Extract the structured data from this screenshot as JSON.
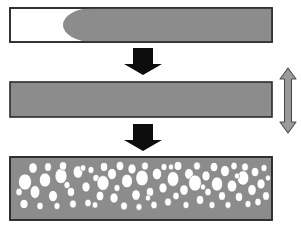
{
  "figure": {
    "type": "process-diagram",
    "width": 301,
    "height": 233,
    "background_color": "#ffffff"
  },
  "colors": {
    "material_gray": "#8c8c8c",
    "outline_dark": "#2b2b2b",
    "cavity_white": "#ffffff",
    "arrow_black": "#0d0d0d",
    "expansion_arrow_fill": "#9a9a9a",
    "expansion_arrow_stroke": "#4d4d4d",
    "pore_white": "#ffffff",
    "pore_stroke": "#6e6e6e"
  },
  "stages": [
    {
      "id": "stage-1-partial-fill",
      "label": "Partially filled cavity with advancing melt front",
      "x": 10,
      "y": 8,
      "width": 262,
      "height": 34,
      "fill": "#ffffff",
      "stroke": "#2b2b2b",
      "melt": {
        "label": "Injected melt with rounded flow front",
        "fill": "#8c8c8c",
        "front_x": 93,
        "right_x": 272,
        "front_radius_x": 30
      }
    },
    {
      "id": "stage-2-full-fill",
      "label": "Completely filled cavity, solid melt",
      "x": 10,
      "y": 82,
      "width": 262,
      "height": 35,
      "fill": "#8c8c8c",
      "stroke": "#2b2b2b"
    },
    {
      "id": "stage-3-foamed",
      "label": "Foamed part with cellular pore structure",
      "x": 10,
      "y": 157,
      "width": 262,
      "height": 63,
      "fill": "#8c8c8c",
      "stroke": "#2b2b2b"
    }
  ],
  "flow_arrows": [
    {
      "id": "flow-arrow-1",
      "label": "Process step from stage 1 to stage 2",
      "cx": 143,
      "top_y": 48,
      "bottom_y": 75,
      "shaft_half_width": 10,
      "head_half_width": 19,
      "head_height": 11,
      "fill": "#0d0d0d"
    },
    {
      "id": "flow-arrow-2",
      "label": "Process step from stage 2 to stage 3",
      "cx": 143,
      "top_y": 124,
      "bottom_y": 151,
      "shaft_half_width": 10,
      "head_half_width": 19,
      "head_height": 11,
      "fill": "#0d0d0d"
    }
  ],
  "expansion_arrow": {
    "id": "expansion-arrow",
    "label": "Vertical double-headed arrow indicating mould opening / thickness expansion",
    "cx": 288,
    "top_y": 68,
    "bottom_y": 133,
    "shaft_half_width": 3.5,
    "head_half_width": 8,
    "head_height": 11,
    "fill": "#9a9a9a",
    "stroke": "#4d4d4d"
  },
  "pores": {
    "label": "White elliptical gas cells distributed through the foamed bar",
    "fill": "#ffffff",
    "stroke": "#6e6e6e",
    "count": 76,
    "ellipses": [
      {
        "cx": 25,
        "cy": 182,
        "rx": 6.5,
        "ry": 8.0
      },
      {
        "cx": 24,
        "cy": 204,
        "rx": 4.0,
        "ry": 4.6
      },
      {
        "cx": 33,
        "cy": 168,
        "rx": 4.2,
        "ry": 5.2
      },
      {
        "cx": 35,
        "cy": 192,
        "rx": 4.8,
        "ry": 6.4
      },
      {
        "cx": 40,
        "cy": 206,
        "rx": 3.2,
        "ry": 3.8
      },
      {
        "cx": 45,
        "cy": 180,
        "rx": 5.6,
        "ry": 7.0
      },
      {
        "cx": 48,
        "cy": 167,
        "rx": 3.4,
        "ry": 4.2
      },
      {
        "cx": 53,
        "cy": 196,
        "rx": 4.4,
        "ry": 5.6
      },
      {
        "cx": 57,
        "cy": 206,
        "rx": 3.0,
        "ry": 3.6
      },
      {
        "cx": 61,
        "cy": 176,
        "rx": 6.0,
        "ry": 7.6
      },
      {
        "cx": 63,
        "cy": 166,
        "rx": 3.6,
        "ry": 4.2
      },
      {
        "cx": 71,
        "cy": 192,
        "rx": 3.6,
        "ry": 4.4
      },
      {
        "cx": 73,
        "cy": 204,
        "rx": 3.4,
        "ry": 4.0
      },
      {
        "cx": 78,
        "cy": 172,
        "rx": 4.8,
        "ry": 6.2
      },
      {
        "cx": 86,
        "cy": 187,
        "rx": 4.0,
        "ry": 5.0
      },
      {
        "cx": 88,
        "cy": 203,
        "rx": 3.2,
        "ry": 3.8
      },
      {
        "cx": 91,
        "cy": 170,
        "rx": 3.0,
        "ry": 3.6
      },
      {
        "cx": 96,
        "cy": 178,
        "rx": 3.2,
        "ry": 3.6
      },
      {
        "cx": 100,
        "cy": 196,
        "rx": 3.8,
        "ry": 4.8
      },
      {
        "cx": 103,
        "cy": 183,
        "rx": 6.0,
        "ry": 7.4
      },
      {
        "cx": 104,
        "cy": 167,
        "rx": 3.6,
        "ry": 4.4
      },
      {
        "cx": 112,
        "cy": 174,
        "rx": 4.4,
        "ry": 5.6
      },
      {
        "cx": 114,
        "cy": 198,
        "rx": 4.0,
        "ry": 5.0
      },
      {
        "cx": 117,
        "cy": 188,
        "rx": 3.0,
        "ry": 3.6
      },
      {
        "cx": 120,
        "cy": 166,
        "rx": 3.8,
        "ry": 4.6
      },
      {
        "cx": 124,
        "cy": 206,
        "rx": 3.4,
        "ry": 4.0
      },
      {
        "cx": 127,
        "cy": 181,
        "rx": 5.4,
        "ry": 6.8
      },
      {
        "cx": 132,
        "cy": 169,
        "rx": 4.0,
        "ry": 5.0
      },
      {
        "cx": 136,
        "cy": 195,
        "rx": 4.2,
        "ry": 5.2
      },
      {
        "cx": 139,
        "cy": 207,
        "rx": 3.0,
        "ry": 3.4
      },
      {
        "cx": 142,
        "cy": 178,
        "rx": 6.2,
        "ry": 7.8
      },
      {
        "cx": 145,
        "cy": 166,
        "rx": 3.4,
        "ry": 4.0
      },
      {
        "cx": 150,
        "cy": 192,
        "rx": 3.6,
        "ry": 4.4
      },
      {
        "cx": 154,
        "cy": 205,
        "rx": 3.2,
        "ry": 3.8
      },
      {
        "cx": 157,
        "cy": 174,
        "rx": 4.6,
        "ry": 5.8
      },
      {
        "cx": 163,
        "cy": 188,
        "rx": 4.0,
        "ry": 5.0
      },
      {
        "cx": 164,
        "cy": 167,
        "rx": 3.0,
        "ry": 3.6
      },
      {
        "cx": 168,
        "cy": 202,
        "rx": 3.4,
        "ry": 4.0
      },
      {
        "cx": 173,
        "cy": 179,
        "rx": 5.8,
        "ry": 7.4
      },
      {
        "cx": 176,
        "cy": 196,
        "rx": 3.2,
        "ry": 3.8
      },
      {
        "cx": 178,
        "cy": 166,
        "rx": 3.8,
        "ry": 4.4
      },
      {
        "cx": 184,
        "cy": 190,
        "rx": 4.2,
        "ry": 5.2
      },
      {
        "cx": 186,
        "cy": 205,
        "rx": 3.0,
        "ry": 3.6
      },
      {
        "cx": 189,
        "cy": 174,
        "rx": 4.4,
        "ry": 5.4
      },
      {
        "cx": 195,
        "cy": 183,
        "rx": 6.4,
        "ry": 8.0
      },
      {
        "cx": 197,
        "cy": 166,
        "rx": 3.4,
        "ry": 4.0
      },
      {
        "cx": 200,
        "cy": 200,
        "rx": 3.6,
        "ry": 4.4
      },
      {
        "cx": 206,
        "cy": 176,
        "rx": 4.0,
        "ry": 5.0
      },
      {
        "cx": 208,
        "cy": 192,
        "rx": 3.2,
        "ry": 3.8
      },
      {
        "cx": 212,
        "cy": 205,
        "rx": 3.0,
        "ry": 3.6
      },
      {
        "cx": 214,
        "cy": 167,
        "rx": 3.8,
        "ry": 4.6
      },
      {
        "cx": 217,
        "cy": 184,
        "rx": 5.6,
        "ry": 7.0
      },
      {
        "cx": 222,
        "cy": 196,
        "rx": 3.4,
        "ry": 4.2
      },
      {
        "cx": 225,
        "cy": 171,
        "rx": 4.4,
        "ry": 5.6
      },
      {
        "cx": 228,
        "cy": 205,
        "rx": 3.0,
        "ry": 3.4
      },
      {
        "cx": 232,
        "cy": 186,
        "rx": 4.8,
        "ry": 6.0
      },
      {
        "cx": 234,
        "cy": 166,
        "rx": 3.2,
        "ry": 3.8
      },
      {
        "cx": 239,
        "cy": 197,
        "rx": 3.6,
        "ry": 4.4
      },
      {
        "cx": 243,
        "cy": 178,
        "rx": 5.8,
        "ry": 7.2
      },
      {
        "cx": 245,
        "cy": 167,
        "rx": 3.4,
        "ry": 4.0
      },
      {
        "cx": 248,
        "cy": 204,
        "rx": 3.0,
        "ry": 3.6
      },
      {
        "cx": 252,
        "cy": 190,
        "rx": 4.2,
        "ry": 5.4
      },
      {
        "cx": 255,
        "cy": 172,
        "rx": 3.8,
        "ry": 4.6
      },
      {
        "cx": 258,
        "cy": 202,
        "rx": 3.2,
        "ry": 3.8
      },
      {
        "cx": 261,
        "cy": 184,
        "rx": 4.0,
        "ry": 5.0
      },
      {
        "cx": 264,
        "cy": 168,
        "rx": 3.0,
        "ry": 3.6
      },
      {
        "cx": 266,
        "cy": 196,
        "rx": 3.4,
        "ry": 4.2
      },
      {
        "cx": 19,
        "cy": 192,
        "rx": 3.2,
        "ry": 3.8
      },
      {
        "cx": 67,
        "cy": 185,
        "rx": 3.0,
        "ry": 3.6
      },
      {
        "cx": 83,
        "cy": 168,
        "rx": 2.8,
        "ry": 3.2
      },
      {
        "cx": 95,
        "cy": 205,
        "rx": 2.8,
        "ry": 3.2
      },
      {
        "cx": 148,
        "cy": 198,
        "rx": 2.6,
        "ry": 3.0
      },
      {
        "cx": 171,
        "cy": 167,
        "rx": 2.6,
        "ry": 3.0
      },
      {
        "cx": 203,
        "cy": 187,
        "rx": 2.6,
        "ry": 3.0
      },
      {
        "cx": 237,
        "cy": 176,
        "rx": 2.6,
        "ry": 3.0
      },
      {
        "cx": 268,
        "cy": 178,
        "rx": 2.6,
        "ry": 3.0
      }
    ]
  }
}
